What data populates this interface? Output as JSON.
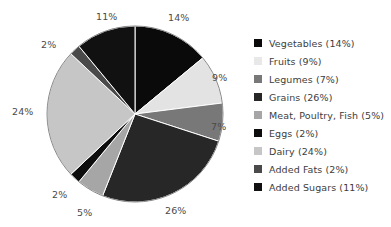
{
  "chart_data": {
    "type": "pie",
    "title": "",
    "subtitle": "",
    "xlabel": "",
    "ylabel": "",
    "legend_position": "right",
    "grid": false,
    "start_angle_deg": 0,
    "direction": "clockwise",
    "categories": [
      "Vegetables",
      "Fruits",
      "Legumes",
      "Grains",
      "Meat, Poultry, Fish",
      "Eggs",
      "Dairy",
      "Added Fats",
      "Added Sugars"
    ],
    "values": [
      14,
      9,
      7,
      26,
      5,
      2,
      24,
      2,
      11
    ],
    "value_unit": "%",
    "slice_labels": [
      "14%",
      "9%",
      "7%",
      "26%",
      "5%",
      "2%",
      "24%",
      "2%",
      "11%"
    ],
    "colors": [
      "#0a0a0a",
      "#e3e3e3",
      "#787878",
      "#272727",
      "#a6a6a6",
      "#0d0d0d",
      "#c6c6c6",
      "#4a4a4a",
      "#111111"
    ],
    "legend_entries": [
      {
        "label": "Vegetables (14%)",
        "swatch": "#0a0a0a"
      },
      {
        "label": "Fruits (9%)",
        "swatch": "#e8e8e8"
      },
      {
        "label": "Legumes (7%)",
        "swatch": "#787878"
      },
      {
        "label": "Grains (26%)",
        "swatch": "#272727"
      },
      {
        "label": "Meat, Poultry, Fish (5%)",
        "swatch": "#a6a6a6"
      },
      {
        "label": "Eggs (2%)",
        "swatch": "#0d0d0d"
      },
      {
        "label": "Dairy (24%)",
        "swatch": "#c6c6c6"
      },
      {
        "label": "Added Fats (2%)",
        "swatch": "#4a4a4a"
      },
      {
        "label": "Added Sugars (11%)",
        "swatch": "#111111"
      }
    ]
  },
  "pie_labels": [
    {
      "text": "14%",
      "left": 168,
      "top": 13
    },
    {
      "text": "9%",
      "left": 212,
      "top": 73
    },
    {
      "text": "7%",
      "left": 211,
      "top": 122
    },
    {
      "text": "26%",
      "left": 165,
      "top": 206
    },
    {
      "text": "5%",
      "left": 77,
      "top": 208
    },
    {
      "text": "2%",
      "left": 52,
      "top": 190
    },
    {
      "text": "24%",
      "left": 12,
      "top": 107
    },
    {
      "text": "2%",
      "left": 41,
      "top": 40
    },
    {
      "text": "11%",
      "left": 96,
      "top": 12
    }
  ],
  "geometry": {
    "cx": 135,
    "cy": 114,
    "r": 88
  }
}
